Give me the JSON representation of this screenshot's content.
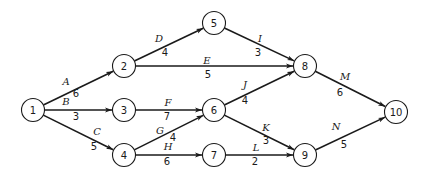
{
  "diagram": {
    "type": "activity-on-arrow network",
    "nodes": [
      {
        "id": "1",
        "x": 33,
        "y": 110
      },
      {
        "id": "2",
        "x": 124,
        "y": 66
      },
      {
        "id": "3",
        "x": 124,
        "y": 110
      },
      {
        "id": "4",
        "x": 124,
        "y": 155
      },
      {
        "id": "5",
        "x": 214,
        "y": 23
      },
      {
        "id": "6",
        "x": 214,
        "y": 110
      },
      {
        "id": "7",
        "x": 214,
        "y": 155
      },
      {
        "id": "8",
        "x": 305,
        "y": 66
      },
      {
        "id": "9",
        "x": 305,
        "y": 155
      },
      {
        "id": "10",
        "x": 396,
        "y": 112
      }
    ],
    "edges": [
      {
        "activity": "A",
        "duration": "6",
        "from": "1",
        "to": "2",
        "ax": 66,
        "ay": 85,
        "dx": 76,
        "dy": 97
      },
      {
        "activity": "B",
        "duration": "3",
        "from": "1",
        "to": "3",
        "ax": 66,
        "ay": 105,
        "dx": 76,
        "dy": 120
      },
      {
        "activity": "C",
        "duration": "5",
        "from": "1",
        "to": "4",
        "ax": 97,
        "ay": 135,
        "dx": 94,
        "dy": 150
      },
      {
        "activity": "D",
        "duration": "4",
        "from": "2",
        "to": "5",
        "ax": 159,
        "ay": 42,
        "dx": 165,
        "dy": 56
      },
      {
        "activity": "E",
        "duration": "5",
        "from": "2",
        "to": "8",
        "ax": 207,
        "ay": 64,
        "dx": 208,
        "dy": 78
      },
      {
        "activity": "F",
        "duration": "7",
        "from": "3",
        "to": "6",
        "ax": 168,
        "ay": 106,
        "dx": 167,
        "dy": 120
      },
      {
        "activity": "G",
        "duration": "4",
        "from": "4",
        "to": "6",
        "ax": 160,
        "ay": 134,
        "dx": 173,
        "dy": 141
      },
      {
        "activity": "H",
        "duration": "6",
        "from": "4",
        "to": "7",
        "ax": 168,
        "ay": 150,
        "dx": 167,
        "dy": 165
      },
      {
        "activity": "I",
        "duration": "3",
        "from": "5",
        "to": "8",
        "ax": 260,
        "ay": 42,
        "dx": 258,
        "dy": 56
      },
      {
        "activity": "J",
        "duration": "4",
        "from": "6",
        "to": "8",
        "ax": 245,
        "ay": 88,
        "dx": 245,
        "dy": 104
      },
      {
        "activity": "K",
        "duration": "3",
        "from": "6",
        "to": "9",
        "ax": 266,
        "ay": 131,
        "dx": 266,
        "dy": 144
      },
      {
        "activity": "L",
        "duration": "2",
        "from": "7",
        "to": "9",
        "ax": 256,
        "ay": 151,
        "dx": 255,
        "dy": 165
      },
      {
        "activity": "M",
        "duration": "6",
        "from": "8",
        "to": "10",
        "ax": 345,
        "ay": 80,
        "dx": 340,
        "dy": 96
      },
      {
        "activity": "N",
        "duration": "5",
        "from": "9",
        "to": "10",
        "ax": 336,
        "ay": 130,
        "dx": 344,
        "dy": 148
      }
    ]
  }
}
